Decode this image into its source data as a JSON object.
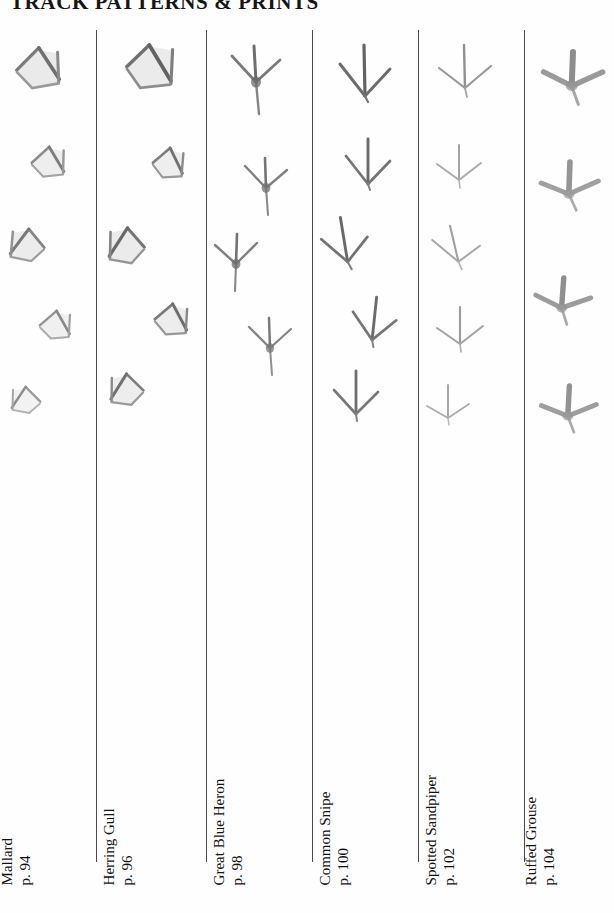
{
  "page": {
    "title": "TRACK PATTERNS & PRINTS",
    "background_color": "#fefefe",
    "ink_color": "#4a4a4a",
    "width": 614,
    "height": 913
  },
  "columns": [
    {
      "id": "mallard",
      "species": "Mallard",
      "page_ref": "p. 94",
      "track_type": "webbed",
      "ink_tone": "#8e8e8e",
      "print_count": 5
    },
    {
      "id": "herring-gull",
      "species": "Herring Gull",
      "page_ref": "p. 96",
      "track_type": "webbed",
      "ink_tone": "#7d7d7d",
      "print_count": 5
    },
    {
      "id": "great-blue-heron",
      "species": "Great Blue Heron",
      "page_ref": "p. 98",
      "track_type": "three-toed-with-hallux",
      "ink_tone": "#8a8a8a",
      "print_count": 4
    },
    {
      "id": "common-snipe",
      "species": "Common Snipe",
      "page_ref": "p. 100",
      "track_type": "three-toed-arrow",
      "ink_tone": "#777777",
      "print_count": 5
    },
    {
      "id": "spotted-sandpiper",
      "species": "Spotted Sandpiper",
      "page_ref": "p. 102",
      "track_type": "three-toed-light",
      "ink_tone": "#a9a9a9",
      "print_count": 5
    },
    {
      "id": "ruffed-grouse",
      "species": "Ruffed Grouse",
      "page_ref": "p. 104",
      "track_type": "broad-three-toed-with-hallux",
      "ink_tone": "#9a9a9a",
      "print_count": 4
    }
  ]
}
